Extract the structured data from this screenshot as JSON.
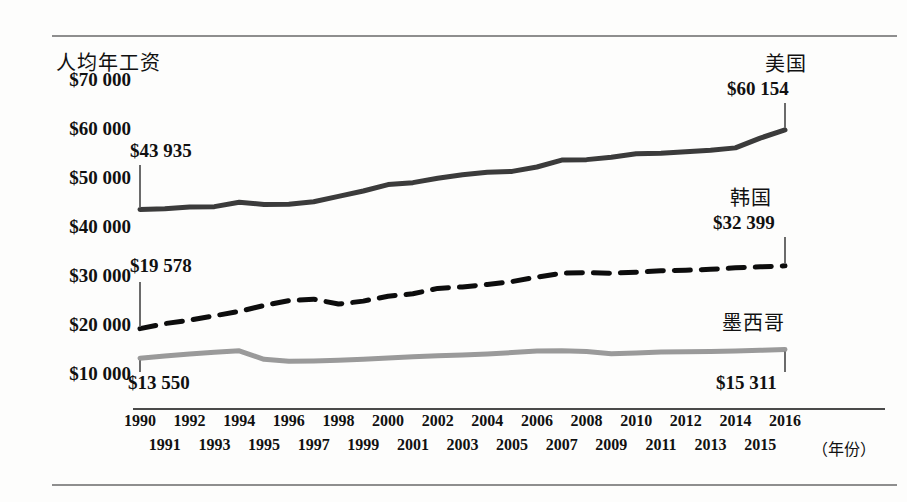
{
  "chart_data": {
    "type": "line",
    "title": "",
    "ylabel": "人均年工资",
    "xlabel": "（年份）",
    "grid": false,
    "legend_position": "inline-right-labels",
    "ylim": [
      5000,
      72000
    ],
    "yticks": [
      "$10 000",
      "$20 000",
      "$30 000",
      "$40 000",
      "$50 000",
      "$60 000",
      "$70 000"
    ],
    "ytick_values": [
      10000,
      20000,
      30000,
      40000,
      50000,
      60000,
      70000
    ],
    "x": [
      1990,
      1991,
      1992,
      1993,
      1994,
      1995,
      1996,
      1997,
      1998,
      1999,
      2000,
      2001,
      2002,
      2003,
      2004,
      2005,
      2006,
      2007,
      2008,
      2009,
      2010,
      2011,
      2012,
      2013,
      2014,
      2015,
      2016
    ],
    "xtick_labels_row0": [
      "1990",
      "1992",
      "1994",
      "1996",
      "1998",
      "2000",
      "2002",
      "2004",
      "2006",
      "2008",
      "2010",
      "2012",
      "2014",
      "2016"
    ],
    "xtick_labels_row1": [
      "1991",
      "1993",
      "1995",
      "1997",
      "1999",
      "2001",
      "2003",
      "2005",
      "2007",
      "2009",
      "2011",
      "2013",
      "2015"
    ],
    "series": [
      {
        "name": "美国",
        "style": "solid",
        "color": "#3b3b3b",
        "width": 5,
        "start_label": "$43 935",
        "end_label": "$60 154",
        "start_value": 43935,
        "end_value": 60154,
        "values": [
          43935,
          44050,
          44400,
          44500,
          45400,
          44950,
          45000,
          45500,
          46600,
          47700,
          49000,
          49400,
          50300,
          51000,
          51500,
          51700,
          52600,
          54000,
          54100,
          54600,
          55300,
          55400,
          55700,
          56000,
          56500,
          58500,
          60154
        ]
      },
      {
        "name": "韩国",
        "style": "dashed",
        "color": "#0d0d0d",
        "width": 5,
        "start_label": "$19 578",
        "end_label": "$32 399",
        "start_value": 19578,
        "end_value": 32399,
        "values": [
          19578,
          20600,
          21300,
          22200,
          23100,
          24300,
          25300,
          25600,
          24600,
          25200,
          26200,
          26700,
          27800,
          28100,
          28600,
          29200,
          30100,
          30900,
          31000,
          30900,
          31100,
          31400,
          31500,
          31700,
          32000,
          32200,
          32399
        ]
      },
      {
        "name": "墨西哥",
        "style": "solid",
        "color": "#9a9a9a",
        "width": 5,
        "start_label": "$13 550",
        "end_label": "$15 311",
        "start_value": 13550,
        "end_value": 15311,
        "values": [
          13550,
          14000,
          14400,
          14750,
          15050,
          13300,
          12900,
          12950,
          13100,
          13300,
          13600,
          13850,
          14050,
          14200,
          14400,
          14700,
          15000,
          15050,
          14900,
          14450,
          14600,
          14800,
          14850,
          14900,
          15000,
          15150,
          15311
        ]
      }
    ]
  },
  "annotations": {
    "us_name": "美国",
    "us_end": "$60 154",
    "us_start": "$43 935",
    "kr_name": "韩国",
    "kr_end": "$32 399",
    "kr_start": "$19 578",
    "mx_name": "墨西哥",
    "mx_end": "$15 311",
    "mx_start": "$13 550"
  },
  "axis": {
    "y_title": "人均年工资",
    "x_title": "（年份）"
  }
}
